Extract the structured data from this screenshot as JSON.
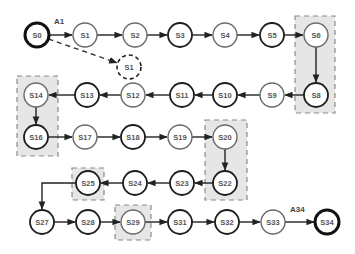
{
  "diagram": {
    "type": "state-sequence",
    "start_edge_label": "A1",
    "end_edge_label": "A34",
    "colors": {
      "background": "#ffffff",
      "node_fill": "#ffffff",
      "dark_stroke": "#1e1e1e",
      "light_stroke": "#6a6a6a",
      "group_fill": "#e6e6e6",
      "group_stroke": "#8a8a8a",
      "edge": "#222222"
    },
    "nodes": [
      {
        "id": "S0",
        "label": "S0",
        "x": 37,
        "y": 35,
        "style": "terminal"
      },
      {
        "id": "S1",
        "label": "S1",
        "x": 85,
        "y": 35,
        "style": "light"
      },
      {
        "id": "S2",
        "label": "S2",
        "x": 135,
        "y": 35,
        "style": "light"
      },
      {
        "id": "S3",
        "label": "S3",
        "x": 180,
        "y": 35,
        "style": "dark"
      },
      {
        "id": "S4",
        "label": "S4",
        "x": 225,
        "y": 35,
        "style": "light"
      },
      {
        "id": "S5",
        "label": "S5",
        "x": 272,
        "y": 35,
        "style": "dark"
      },
      {
        "id": "S6",
        "label": "S6",
        "x": 316,
        "y": 35,
        "style": "light"
      },
      {
        "id": "S1b",
        "label": "S1",
        "x": 129,
        "y": 67,
        "style": "ghost"
      },
      {
        "id": "S8",
        "label": "S8",
        "x": 316,
        "y": 95,
        "style": "dark"
      },
      {
        "id": "S9",
        "label": "S9",
        "x": 272,
        "y": 95,
        "style": "light"
      },
      {
        "id": "S10",
        "label": "S10",
        "x": 225,
        "y": 95,
        "style": "dark"
      },
      {
        "id": "S11",
        "label": "S11",
        "x": 182,
        "y": 95,
        "style": "dark"
      },
      {
        "id": "S12",
        "label": "S12",
        "x": 133,
        "y": 95,
        "style": "light"
      },
      {
        "id": "S13",
        "label": "S13",
        "x": 87,
        "y": 95,
        "style": "dark"
      },
      {
        "id": "S14",
        "label": "S14",
        "x": 36,
        "y": 95,
        "style": "light"
      },
      {
        "id": "S16",
        "label": "S16",
        "x": 36,
        "y": 137,
        "style": "dark"
      },
      {
        "id": "S17",
        "label": "S17",
        "x": 85,
        "y": 137,
        "style": "light"
      },
      {
        "id": "S18",
        "label": "S18",
        "x": 133,
        "y": 137,
        "style": "dark"
      },
      {
        "id": "S19",
        "label": "S19",
        "x": 180,
        "y": 137,
        "style": "light"
      },
      {
        "id": "S20",
        "label": "S20",
        "x": 225,
        "y": 137,
        "style": "light"
      },
      {
        "id": "S22",
        "label": "S22",
        "x": 225,
        "y": 183,
        "style": "dark"
      },
      {
        "id": "S23",
        "label": "S23",
        "x": 182,
        "y": 183,
        "style": "dark"
      },
      {
        "id": "S24",
        "label": "S24",
        "x": 135,
        "y": 183,
        "style": "dark"
      },
      {
        "id": "S25",
        "label": "S25",
        "x": 88,
        "y": 183,
        "style": "dark"
      },
      {
        "id": "S27",
        "label": "S27",
        "x": 42,
        "y": 222,
        "style": "dark"
      },
      {
        "id": "S28",
        "label": "S28",
        "x": 88,
        "y": 222,
        "style": "dark"
      },
      {
        "id": "S29",
        "label": "S29",
        "x": 133,
        "y": 222,
        "style": "light"
      },
      {
        "id": "S31",
        "label": "S31",
        "x": 180,
        "y": 222,
        "style": "dark"
      },
      {
        "id": "S32",
        "label": "S32",
        "x": 227,
        "y": 222,
        "style": "dark"
      },
      {
        "id": "S33",
        "label": "S33",
        "x": 273,
        "y": 222,
        "style": "light"
      },
      {
        "id": "S34",
        "label": "S34",
        "x": 327,
        "y": 222,
        "style": "terminal"
      }
    ],
    "edges": [
      [
        "S0",
        "S1"
      ],
      [
        "S1",
        "S2"
      ],
      [
        "S2",
        "S3"
      ],
      [
        "S3",
        "S4"
      ],
      [
        "S4",
        "S5"
      ],
      [
        "S5",
        "S6"
      ],
      [
        "S6",
        "S8"
      ],
      [
        "S8",
        "S9"
      ],
      [
        "S9",
        "S10"
      ],
      [
        "S10",
        "S11"
      ],
      [
        "S11",
        "S12"
      ],
      [
        "S12",
        "S13"
      ],
      [
        "S13",
        "S14"
      ],
      [
        "S14",
        "S16"
      ],
      [
        "S16",
        "S17"
      ],
      [
        "S17",
        "S18"
      ],
      [
        "S18",
        "S19"
      ],
      [
        "S19",
        "S20"
      ],
      [
        "S20",
        "S22"
      ],
      [
        "S22",
        "S23"
      ],
      [
        "S23",
        "S24"
      ],
      [
        "S24",
        "S25"
      ],
      [
        "S25",
        "S27"
      ],
      [
        "S27",
        "S28"
      ],
      [
        "S28",
        "S29"
      ],
      [
        "S29",
        "S31"
      ],
      [
        "S31",
        "S32"
      ],
      [
        "S32",
        "S33"
      ],
      [
        "S33",
        "S34"
      ]
    ],
    "dashed_edges": [
      [
        "S0",
        "S1b"
      ]
    ],
    "groups": [
      {
        "name": "group-s6-s8",
        "x": 295,
        "y": 16,
        "w": 40,
        "h": 97
      },
      {
        "name": "group-s14-s16",
        "x": 17,
        "y": 76,
        "w": 41,
        "h": 80
      },
      {
        "name": "group-s20-s22",
        "x": 205,
        "y": 120,
        "w": 42,
        "h": 80
      },
      {
        "name": "group-s25",
        "x": 72,
        "y": 168,
        "w": 32,
        "h": 32
      },
      {
        "name": "group-s29",
        "x": 115,
        "y": 205,
        "w": 36,
        "h": 35
      }
    ]
  }
}
